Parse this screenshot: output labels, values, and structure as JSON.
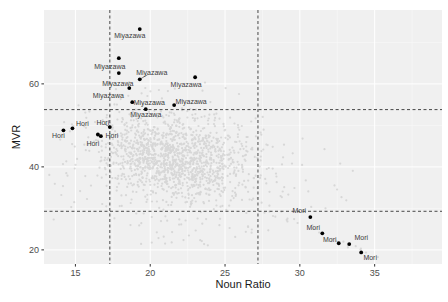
{
  "chart_data": {
    "type": "scatter",
    "title": "",
    "xlabel": "Noun Ratio",
    "ylabel": "MVR",
    "x_ticks": [
      15,
      20,
      25,
      30,
      35
    ],
    "y_ticks": [
      20,
      40,
      60
    ],
    "x_minor": [
      17.5,
      22.5,
      27.5,
      32.5,
      37.5
    ],
    "y_minor": [
      30,
      50,
      70
    ],
    "x_range": [
      12.9,
      39.5
    ],
    "y_range": [
      16.6,
      77.8
    ],
    "grid": "on",
    "legend": "none",
    "reference_lines": {
      "style": "dashed",
      "color": "#333333",
      "vertical_x": [
        17.3,
        27.2
      ],
      "horizontal_y": [
        53.8,
        29.3
      ]
    },
    "series": [
      {
        "name": "Miyazawa",
        "color": "#000000",
        "points": [
          {
            "x": 19.3,
            "y": 73.2,
            "dx": -10,
            "dy": 7
          },
          {
            "x": 17.9,
            "y": 66.2,
            "dx": -9,
            "dy": 8
          },
          {
            "x": 17.9,
            "y": 62.6,
            "dx": -1,
            "dy": 11
          },
          {
            "x": 19.3,
            "y": 61.1,
            "dx": 12,
            "dy": -7,
            "leader": true
          },
          {
            "x": 23.0,
            "y": 61.6,
            "dx": -9,
            "dy": 7
          },
          {
            "x": 18.6,
            "y": 59.0,
            "dx": -21,
            "dy": 8
          },
          {
            "x": 18.8,
            "y": 55.6,
            "dx": 17,
            "dy": 0
          },
          {
            "x": 21.6,
            "y": 54.9,
            "dx": 17,
            "dy": -3
          },
          {
            "x": 19.7,
            "y": 53.9,
            "dx": 0,
            "dy": 5
          }
        ]
      },
      {
        "name": "Hori",
        "color": "#000000",
        "points": [
          {
            "x": 14.2,
            "y": 48.8,
            "dx": -5,
            "dy": 5
          },
          {
            "x": 14.8,
            "y": 49.3,
            "dx": 10,
            "dy": -5
          },
          {
            "x": 17.3,
            "y": 49.6,
            "dx": -7,
            "dy": -4,
            "leader": true
          },
          {
            "x": 16.5,
            "y": 47.8,
            "dx": 14,
            "dy": 1
          },
          {
            "x": 16.7,
            "y": 47.4,
            "dx": -8,
            "dy": 7
          }
        ]
      },
      {
        "name": "Mori",
        "color": "#000000",
        "points": [
          {
            "x": 30.7,
            "y": 27.9,
            "dx": -11,
            "dy": -7
          },
          {
            "x": 31.5,
            "y": 24.0,
            "dx": -9,
            "dy": -6
          },
          {
            "x": 32.6,
            "y": 21.6,
            "dx": -9,
            "dy": -4
          },
          {
            "x": 33.3,
            "y": 21.4,
            "dx": 12,
            "dy": -6
          },
          {
            "x": 34.1,
            "y": 19.4,
            "dx": 9,
            "dy": 5
          }
        ]
      }
    ],
    "background_points": {
      "description": "unlabeled corpus points",
      "color": "#c3c3c3",
      "opacity": 0.55,
      "radius": 1.1,
      "seed": 7,
      "groups": [
        {
          "type": "gaussian",
          "n": 1250,
          "cx": 21.7,
          "cy": 42.0,
          "sx": 2.35,
          "sy": 5.0,
          "rho": -0.15
        },
        {
          "type": "gaussian",
          "n": 130,
          "cx": 21.2,
          "cy": 46.5,
          "sx": 3.0,
          "sy": 3.5,
          "rho": 0
        },
        {
          "type": "uniform",
          "n": 100,
          "x0": 13.5,
          "x1": 28.0,
          "y0": 24.0,
          "y1": 55.0
        },
        {
          "type": "uniform",
          "n": 20,
          "x0": 26.8,
          "x1": 30.5,
          "y0": 29.0,
          "y1": 52.0
        },
        {
          "type": "uniform",
          "n": 10,
          "x0": 30.5,
          "x1": 34.5,
          "y0": 30.0,
          "y1": 47.0
        },
        {
          "type": "uniform",
          "n": 14,
          "x0": 17.5,
          "x1": 26.0,
          "y0": 55.0,
          "y1": 60.5
        },
        {
          "type": "uniform",
          "n": 22,
          "x0": 18.5,
          "x1": 27.0,
          "y0": 21.0,
          "y1": 28.5
        },
        {
          "type": "trail",
          "n": 26,
          "x0": 27.5,
          "y0": 30.0,
          "x1": 35.5,
          "y1": 17.5,
          "jitter": 1.5
        }
      ]
    },
    "panel": {
      "bg": "#f0f0f0",
      "grid_major": "#ffffff",
      "grid_minor": "#f8f8f8",
      "tick_color": "#333333",
      "tick_label_color": "#4d4d4d",
      "point_label_color": "#3c3c3c"
    }
  }
}
